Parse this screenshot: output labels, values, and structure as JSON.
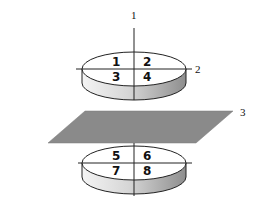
{
  "diagram": {
    "axis_labels": {
      "axis1": "1",
      "axis2": "2",
      "plane3": "3"
    },
    "top_disk": {
      "quadrants": [
        "1",
        "2",
        "3",
        "4"
      ]
    },
    "bottom_disk": {
      "quadrants": [
        "5",
        "6",
        "7",
        "8"
      ]
    },
    "colors": {
      "plane": "#8a8a8a",
      "disk_side_light": "#f2f2f2",
      "disk_side_dark": "#9a9a9a",
      "line": "#222222"
    }
  }
}
